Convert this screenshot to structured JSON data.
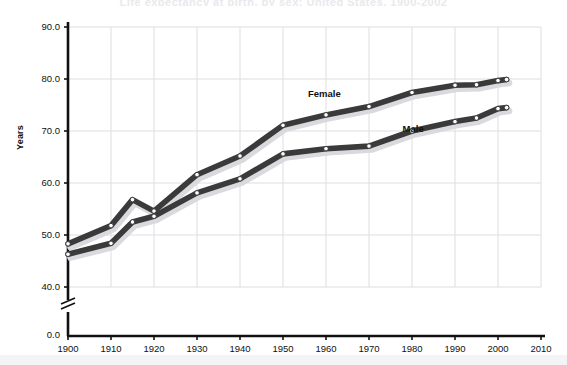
{
  "chart_data": {
    "type": "line",
    "title": "Life expectancy at birth, by sex: United States, 1900-2002",
    "xlabel": "",
    "ylabel": "Years",
    "xlim": [
      1900,
      2010
    ],
    "ylim": [
      40.0,
      90.0
    ],
    "y_axis_break": true,
    "y_zero_label": "0.0",
    "grid": true,
    "legend": "inline-annotations",
    "xticks": [
      "1900",
      "1910",
      "1920",
      "1930",
      "1940",
      "1950",
      "1960",
      "1970",
      "1980",
      "1990",
      "2000",
      "2010"
    ],
    "yticks": [
      "0.0",
      "40.0",
      "50.0",
      "60.0",
      "70.0",
      "80.0",
      "90.0"
    ],
    "series": [
      {
        "name": "Female",
        "color": "#3a3a3a",
        "x": [
          1900,
          1910,
          1915,
          1920,
          1930,
          1940,
          1950,
          1960,
          1970,
          1980,
          1990,
          1995,
          2000,
          2002
        ],
        "values": [
          48.3,
          51.8,
          56.8,
          54.6,
          61.6,
          65.2,
          71.1,
          73.1,
          74.7,
          77.4,
          78.8,
          78.9,
          79.7,
          79.9
        ]
      },
      {
        "name": "Male",
        "color": "#3a3a3a",
        "x": [
          1900,
          1910,
          1915,
          1920,
          1930,
          1940,
          1950,
          1960,
          1970,
          1980,
          1990,
          1995,
          2000,
          2002
        ],
        "values": [
          46.3,
          48.4,
          52.5,
          53.6,
          58.1,
          60.8,
          65.6,
          66.6,
          67.1,
          70.0,
          71.8,
          72.5,
          74.3,
          74.5
        ]
      }
    ],
    "annotations": [
      {
        "text": "Female",
        "x": 1960,
        "y": 77.0
      },
      {
        "text": "Male",
        "x": 1982,
        "y": 70.2
      }
    ]
  }
}
